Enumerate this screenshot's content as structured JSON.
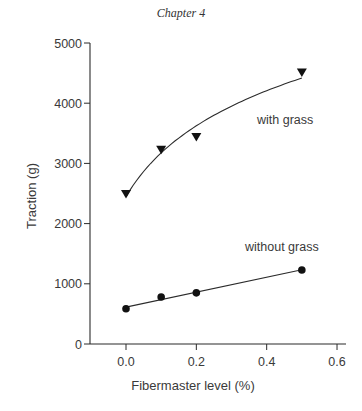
{
  "page": {
    "header": "Chapter 4"
  },
  "chart_data": {
    "type": "scatter",
    "title": "",
    "xlabel": "Fibermaster level (%)",
    "ylabel": "Traction (g)",
    "xlim": [
      -0.1,
      0.62
    ],
    "ylim": [
      0,
      5000
    ],
    "xticks": [
      0.0,
      0.2,
      0.4,
      0.6
    ],
    "xtick_labels": [
      "0.0",
      "0.2",
      "0.4",
      "0.6"
    ],
    "yticks": [
      0,
      1000,
      2000,
      3000,
      4000,
      5000
    ],
    "ytick_labels": [
      "0",
      "1000",
      "2000",
      "3000",
      "4000",
      "5000"
    ],
    "grid": false,
    "legend": "inline labels next to series",
    "series": [
      {
        "name": "with grass",
        "marker": "triangle-down",
        "fit": "curve (logarithmic-like)",
        "x": [
          0.0,
          0.1,
          0.2,
          0.5
        ],
        "values": [
          2490,
          3225,
          3440,
          4510
        ]
      },
      {
        "name": "without grass",
        "marker": "circle",
        "fit": "linear",
        "x": [
          0.0,
          0.1,
          0.2,
          0.5
        ],
        "values": [
          585,
          780,
          850,
          1230
        ]
      }
    ],
    "annotations": [
      {
        "text": "with grass",
        "x": 0.44,
        "y": 3500
      },
      {
        "text": "without grass",
        "x": 0.42,
        "y": 1500
      }
    ]
  }
}
